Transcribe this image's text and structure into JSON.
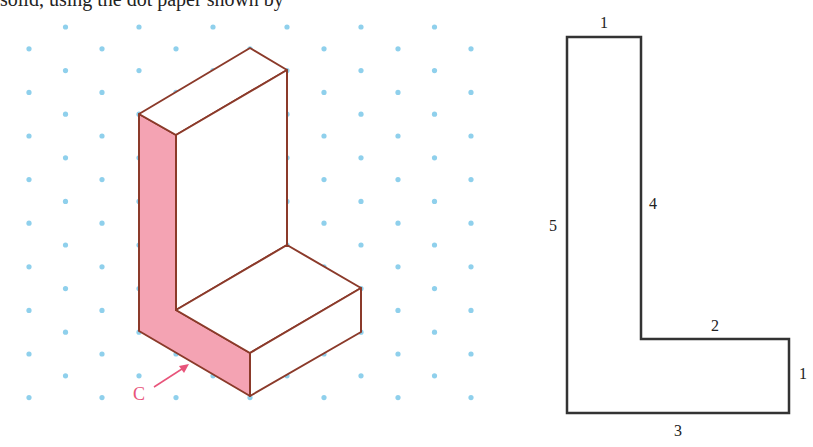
{
  "caption": "solid, using the dot paper shown by",
  "colors": {
    "dot": "#8fd0ec",
    "edge": "#8b3a2a",
    "face_c": "#f4a3b3",
    "outline": "#333333",
    "label_c": "#e8547a"
  },
  "isometric": {
    "face_label": "C",
    "vertices": {
      "top_back": [
        250,
        48
      ],
      "top_right": [
        287,
        70
      ],
      "top_left": [
        139,
        114
      ],
      "top_front": [
        176,
        135
      ],
      "inner_corner": [
        287,
        245
      ],
      "step_back_right": [
        361,
        288
      ],
      "step_front_left": [
        176,
        310
      ],
      "step_right_bottom": [
        361,
        332
      ],
      "front_top": [
        250,
        353
      ],
      "front_bottom": [
        250,
        396
      ],
      "left_bottom": [
        139,
        331
      ]
    }
  },
  "front_view": {
    "labels": {
      "top": "1",
      "left": "5",
      "inner_vertical": "4",
      "step": "2",
      "right": "1",
      "bottom": "3"
    }
  }
}
